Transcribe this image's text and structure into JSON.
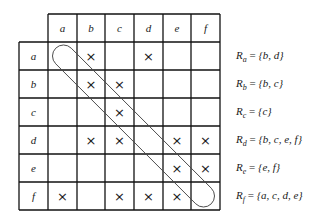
{
  "matrix": {
    "columns": [
      "a",
      "b",
      "c",
      "d",
      "e",
      "f"
    ],
    "rows": [
      "a",
      "b",
      "c",
      "d",
      "e",
      "f"
    ],
    "mark_symbol": "×",
    "cells": [
      [
        0,
        1,
        0,
        1,
        0,
        0
      ],
      [
        0,
        1,
        1,
        0,
        0,
        0
      ],
      [
        0,
        0,
        1,
        0,
        0,
        0
      ],
      [
        0,
        1,
        1,
        0,
        1,
        1
      ],
      [
        0,
        0,
        0,
        0,
        1,
        1
      ],
      [
        1,
        0,
        1,
        1,
        1,
        0
      ]
    ],
    "diagonal_highlight": "capsule from (a,a) to (f,f)"
  },
  "relations": [
    {
      "subscript": "a",
      "set": "{b, d}"
    },
    {
      "subscript": "b",
      "set": "{b, c}"
    },
    {
      "subscript": "c",
      "set": "{c}"
    },
    {
      "subscript": "d",
      "set": "{b, c, e, f}"
    },
    {
      "subscript": "e",
      "set": "{e, f}"
    },
    {
      "subscript": "f",
      "set": "{a, c, d, e}"
    }
  ],
  "relation_prefix": "R",
  "relation_equals": "="
}
